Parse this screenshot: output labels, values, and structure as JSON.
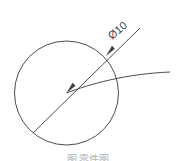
{
  "figure": {
    "background_color": "#ffffff",
    "line_color": "#4d4d4d",
    "arrow_color": "#3f3f3f",
    "width": 176,
    "height": 161,
    "dimension_label": "Ø10",
    "dimension_label_rotation_deg": -40,
    "caption_partial": "图  零件图",
    "circle": {
      "center_x": 66.5,
      "center_y": 93,
      "radius": 52
    },
    "leader_line": {
      "start_x": 33,
      "start_y": 133,
      "end_x": 140,
      "end_y": 28
    },
    "arc_curve": {
      "start_x": 66.5,
      "start_y": 93,
      "end_x": 170,
      "end_y": 72
    },
    "arrowheads": [
      {
        "name": "center-arrowhead",
        "x": 66.5,
        "y": 93
      },
      {
        "name": "circle-intersection-arrowhead",
        "x": 106,
        "y": 56
      }
    ]
  }
}
